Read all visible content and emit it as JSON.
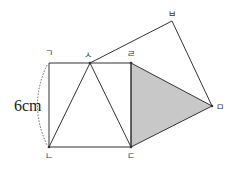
{
  "figure": {
    "measurement_label": "6cm",
    "colors": {
      "stroke": "#333333",
      "shade": "#c8c8c8",
      "dotted": "#666666"
    },
    "points": {
      "giyeok": {
        "label": "ㄱ",
        "x": 49,
        "y": 63
      },
      "siot": {
        "label": "ㅅ",
        "x": 90,
        "y": 63
      },
      "rieul": {
        "label": "ㄹ",
        "x": 131,
        "y": 63
      },
      "nieun": {
        "label": "ㄴ",
        "x": 49,
        "y": 147
      },
      "digeut": {
        "label": "ㄷ",
        "x": 131,
        "y": 147
      },
      "bieup": {
        "label": "ㅂ",
        "x": 172,
        "y": 21
      },
      "mieum": {
        "label": "ㅁ",
        "x": 212,
        "y": 106
      }
    }
  }
}
